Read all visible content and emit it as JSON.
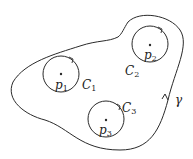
{
  "diagram": {
    "outer_contour": {
      "label": "γ",
      "orientation": "counterclockwise"
    },
    "circles": [
      {
        "label": "C",
        "sub": "1",
        "point": "p",
        "point_sub": "1"
      },
      {
        "label": "C",
        "sub": "2",
        "point": "p",
        "point_sub": "2"
      },
      {
        "label": "C",
        "sub": "3",
        "point": "p",
        "point_sub": "3"
      }
    ],
    "stroke_color": "#2a2a2a"
  }
}
